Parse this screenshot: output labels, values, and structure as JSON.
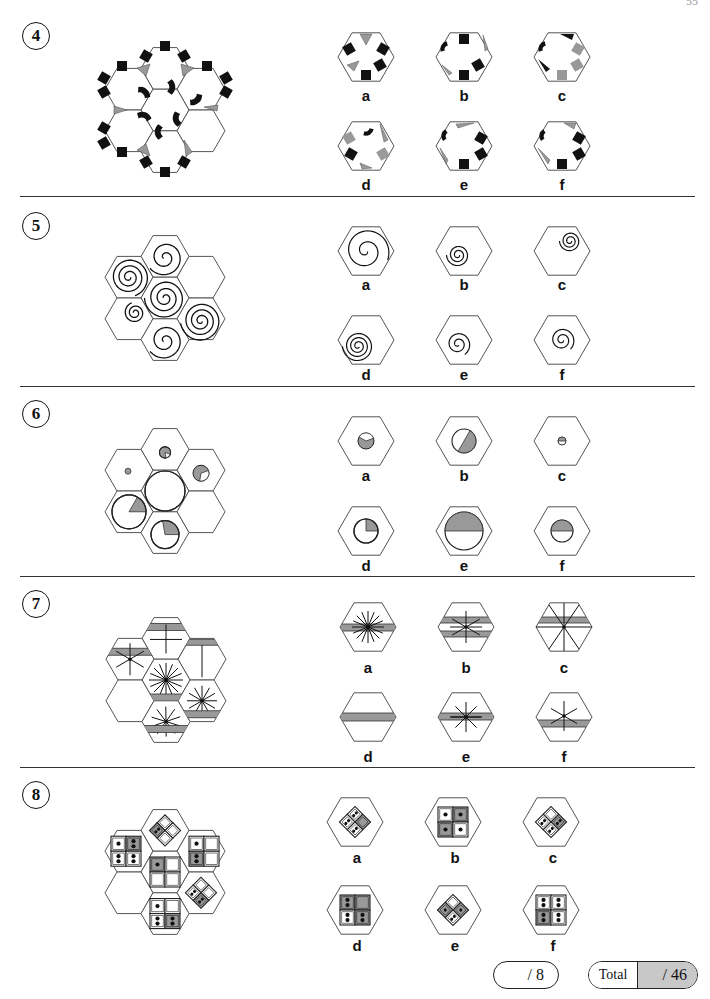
{
  "page": {
    "number": "55"
  },
  "questions": [
    {
      "number": "4",
      "type": "hex-tiles-shapes",
      "options": [
        "a",
        "b",
        "c",
        "d",
        "e",
        "f"
      ]
    },
    {
      "number": "5",
      "type": "hex-spirals",
      "options": [
        "a",
        "b",
        "c",
        "d",
        "e",
        "f"
      ]
    },
    {
      "number": "6",
      "type": "hex-circle-sectors",
      "options": [
        "a",
        "b",
        "c",
        "d",
        "e",
        "f"
      ]
    },
    {
      "number": "7",
      "type": "hex-stripes-lines",
      "options": [
        "a",
        "b",
        "c",
        "d",
        "e",
        "f"
      ]
    },
    {
      "number": "8",
      "type": "hex-dice-squares",
      "options": [
        "a",
        "b",
        "c",
        "d",
        "e",
        "f"
      ]
    }
  ],
  "score": {
    "section": "/ 8",
    "total_label": "Total",
    "total": "/ 46"
  },
  "colors": {
    "line": "#555555",
    "black": "#111111",
    "grey": "#999999"
  }
}
